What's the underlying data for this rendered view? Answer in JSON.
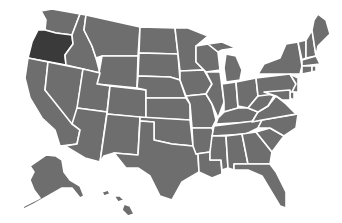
{
  "map": {
    "title": "United States",
    "default_fill": "#6e6e6e",
    "highlight_fill": "#3a3a3a",
    "border_color": "#ffffff",
    "background": "#ffffff",
    "highlighted_states": [
      "Oregon"
    ],
    "states": [
      {
        "name": "Washington",
        "highlighted": false
      },
      {
        "name": "Oregon",
        "highlighted": true
      },
      {
        "name": "California",
        "highlighted": false
      },
      {
        "name": "Idaho",
        "highlighted": false
      },
      {
        "name": "Nevada",
        "highlighted": false
      },
      {
        "name": "Montana",
        "highlighted": false
      },
      {
        "name": "Wyoming",
        "highlighted": false
      },
      {
        "name": "Utah",
        "highlighted": false
      },
      {
        "name": "Arizona",
        "highlighted": false
      },
      {
        "name": "Colorado",
        "highlighted": false
      },
      {
        "name": "New Mexico",
        "highlighted": false
      },
      {
        "name": "North Dakota",
        "highlighted": false
      },
      {
        "name": "South Dakota",
        "highlighted": false
      },
      {
        "name": "Nebraska",
        "highlighted": false
      },
      {
        "name": "Kansas",
        "highlighted": false
      },
      {
        "name": "Oklahoma",
        "highlighted": false
      },
      {
        "name": "Texas",
        "highlighted": false
      },
      {
        "name": "Minnesota",
        "highlighted": false
      },
      {
        "name": "Iowa",
        "highlighted": false
      },
      {
        "name": "Missouri",
        "highlighted": false
      },
      {
        "name": "Arkansas",
        "highlighted": false
      },
      {
        "name": "Louisiana",
        "highlighted": false
      },
      {
        "name": "Wisconsin",
        "highlighted": false
      },
      {
        "name": "Illinois",
        "highlighted": false
      },
      {
        "name": "Michigan",
        "highlighted": false
      },
      {
        "name": "Indiana",
        "highlighted": false
      },
      {
        "name": "Ohio",
        "highlighted": false
      },
      {
        "name": "Kentucky",
        "highlighted": false
      },
      {
        "name": "Tennessee",
        "highlighted": false
      },
      {
        "name": "Mississippi",
        "highlighted": false
      },
      {
        "name": "Alabama",
        "highlighted": false
      },
      {
        "name": "Georgia",
        "highlighted": false
      },
      {
        "name": "Florida",
        "highlighted": false
      },
      {
        "name": "South Carolina",
        "highlighted": false
      },
      {
        "name": "North Carolina",
        "highlighted": false
      },
      {
        "name": "Virginia",
        "highlighted": false
      },
      {
        "name": "West Virginia",
        "highlighted": false
      },
      {
        "name": "Pennsylvania",
        "highlighted": false
      },
      {
        "name": "New York",
        "highlighted": false
      },
      {
        "name": "Vermont",
        "highlighted": false
      },
      {
        "name": "New Hampshire",
        "highlighted": false
      },
      {
        "name": "Maine",
        "highlighted": false
      },
      {
        "name": "Massachusetts",
        "highlighted": false
      },
      {
        "name": "Connecticut",
        "highlighted": false
      },
      {
        "name": "Rhode Island",
        "highlighted": false
      },
      {
        "name": "New Jersey",
        "highlighted": false
      },
      {
        "name": "Delaware",
        "highlighted": false
      },
      {
        "name": "Maryland",
        "highlighted": false
      },
      {
        "name": "Alaska",
        "highlighted": false
      },
      {
        "name": "Hawaii",
        "highlighted": false
      }
    ]
  }
}
